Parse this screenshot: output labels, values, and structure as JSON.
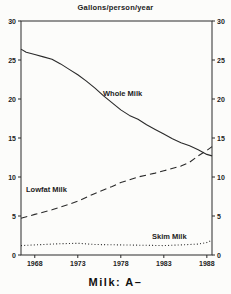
{
  "title": "Gallons/person/year",
  "caption": "Milk: A–",
  "colors": {
    "line": "#2a2a2a",
    "text": "#222222",
    "background": "#fcfcfa"
  },
  "chart_data": {
    "type": "line",
    "title": "Gallons/person/year",
    "xlabel": "",
    "ylabel": "Gallons/person/year",
    "xlim": [
      1966.4,
      1988.6
    ],
    "ylim": [
      0,
      30
    ],
    "x_ticks": [
      1968,
      1973,
      1978,
      1983,
      1988
    ],
    "y_ticks": [
      0,
      5,
      10,
      15,
      20,
      25,
      30
    ],
    "y_axis_sides": [
      "left",
      "right"
    ],
    "grid": false,
    "legend_position": "inline-labels",
    "layout": {
      "plot": {
        "x": 21,
        "y": 21,
        "w": 191,
        "h": 234
      },
      "tick_len": 3
    },
    "series": [
      {
        "name": "Whole Milk",
        "style": "solid",
        "label_px": {
          "x": 103,
          "y": 96
        },
        "points": [
          [
            1966.4,
            26.4
          ],
          [
            1967,
            26.0
          ],
          [
            1968,
            25.7
          ],
          [
            1969,
            25.4
          ],
          [
            1970,
            25.1
          ],
          [
            1971,
            24.5
          ],
          [
            1972,
            23.8
          ],
          [
            1973,
            23.1
          ],
          [
            1974,
            22.3
          ],
          [
            1975,
            21.4
          ],
          [
            1976,
            20.4
          ],
          [
            1977,
            19.5
          ],
          [
            1978,
            18.6
          ],
          [
            1979,
            17.9
          ],
          [
            1980,
            17.4
          ],
          [
            1981,
            16.7
          ],
          [
            1982,
            16.1
          ],
          [
            1983,
            15.5
          ],
          [
            1984,
            14.9
          ],
          [
            1985,
            14.4
          ],
          [
            1986,
            14.0
          ],
          [
            1987,
            13.5
          ],
          [
            1988,
            12.9
          ],
          [
            1988.6,
            12.7
          ]
        ]
      },
      {
        "name": "Lowfat Milk",
        "style": "dashed",
        "label_px": {
          "x": 26,
          "y": 192
        },
        "points": [
          [
            1966.4,
            4.7
          ],
          [
            1968,
            5.2
          ],
          [
            1970,
            5.8
          ],
          [
            1972,
            6.5
          ],
          [
            1973,
            6.9
          ],
          [
            1975,
            7.9
          ],
          [
            1977,
            8.8
          ],
          [
            1978,
            9.3
          ],
          [
            1980,
            10.0
          ],
          [
            1982,
            10.5
          ],
          [
            1983,
            10.8
          ],
          [
            1985,
            11.4
          ],
          [
            1986,
            11.9
          ],
          [
            1987,
            12.7
          ],
          [
            1988,
            13.4
          ],
          [
            1988.6,
            13.9
          ]
        ]
      },
      {
        "name": "Skim Milk",
        "style": "dotted",
        "label_px": {
          "x": 152,
          "y": 239
        },
        "points": [
          [
            1966.4,
            1.2
          ],
          [
            1968,
            1.3
          ],
          [
            1971,
            1.45
          ],
          [
            1973,
            1.5
          ],
          [
            1975,
            1.35
          ],
          [
            1978,
            1.3
          ],
          [
            1981,
            1.25
          ],
          [
            1983,
            1.2
          ],
          [
            1985,
            1.3
          ],
          [
            1987,
            1.4
          ],
          [
            1988,
            1.6
          ],
          [
            1988.6,
            1.9
          ]
        ]
      }
    ]
  }
}
